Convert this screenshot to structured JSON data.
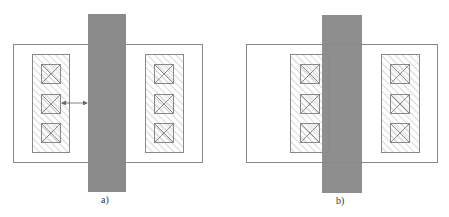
{
  "figure": {
    "panels": [
      {
        "id": "a",
        "caption": "a)"
      },
      {
        "id": "b",
        "caption": "b)"
      }
    ],
    "colors": {
      "gate": "#8a8a8a",
      "outline": "#777777",
      "hatch": "#aaaaaa",
      "background": "#ffffff"
    }
  }
}
